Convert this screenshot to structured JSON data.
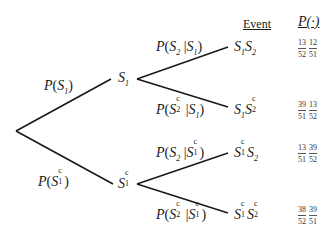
{
  "headers": {
    "event": "Event",
    "probability": "P(·)"
  },
  "root": {},
  "first_stage": [
    {
      "node": {
        "base": "S",
        "sub": "1",
        "sup": ""
      },
      "edge_label": {
        "event": {
          "base": "S",
          "sub": "1",
          "sup": ""
        },
        "given": null
      }
    },
    {
      "node": {
        "base": "S",
        "sub": "1",
        "sup": "c"
      },
      "edge_label": {
        "event": {
          "base": "S",
          "sub": "1",
          "sup": "c"
        },
        "given": null
      }
    }
  ],
  "branches": [
    {
      "edge_label": "P(S2 | S1)",
      "event_label": "S1S2",
      "probability": {
        "fractions": [
          {
            "num": "13",
            "den": "52"
          },
          {
            "num": "12",
            "den": "51"
          }
        ]
      }
    },
    {
      "edge_label": "P(S2c | S1)",
      "event_label": "S1S2c",
      "probability": {
        "fractions": [
          {
            "num": "39",
            "den": "51"
          },
          {
            "num": "13",
            "den": "52"
          }
        ]
      }
    },
    {
      "edge_label": "P(S2 | S1c)",
      "event_label": "S1cS2",
      "probability": {
        "fractions": [
          {
            "num": "13",
            "den": "51"
          },
          {
            "num": "39",
            "den": "52"
          }
        ]
      }
    },
    {
      "edge_label": "P(S2c | S1c)",
      "event_label": "S1cS2c",
      "probability": {
        "fractions": [
          {
            "num": "38",
            "den": "52"
          },
          {
            "num": "39",
            "den": "51"
          }
        ]
      }
    }
  ],
  "text": {
    "P": "P",
    "S": "S",
    "open": "(",
    "close": ")",
    "bar": "|",
    "one": "1",
    "two": "2",
    "c": "c"
  },
  "colors": {
    "line": "#1a1a1a",
    "text": "#1a1a1a",
    "background": "#ffffff"
  }
}
